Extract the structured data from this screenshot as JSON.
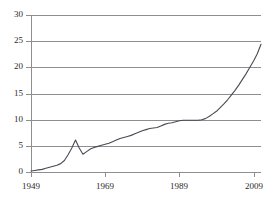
{
  "chart_data": {
    "type": "line",
    "title": "",
    "xlabel": "",
    "ylabel": "",
    "xlim": [
      1949,
      2011
    ],
    "ylim": [
      0,
      30
    ],
    "grid": true,
    "legend": null,
    "y_ticks": [
      0,
      5,
      10,
      15,
      20,
      25,
      30
    ],
    "x_ticks": [
      1949,
      1969,
      1989,
      2009
    ],
    "x_tick_labels": [
      "1949",
      "1969",
      "1989",
      "2009"
    ],
    "y_tick_labels": [
      "0",
      "5",
      "10",
      "15",
      "20",
      "25",
      "30"
    ],
    "series": [
      {
        "name": "series-1",
        "color": "#4a4a55",
        "x": [
          1949,
          1950,
          1951,
          1952,
          1953,
          1954,
          1955,
          1956,
          1957,
          1958,
          1959,
          1960,
          1961,
          1962,
          1963,
          1964,
          1965,
          1966,
          1967,
          1968,
          1969,
          1970,
          1971,
          1972,
          1973,
          1974,
          1975,
          1976,
          1977,
          1978,
          1979,
          1980,
          1981,
          1982,
          1983,
          1984,
          1985,
          1986,
          1987,
          1988,
          1989,
          1990,
          1991,
          1992,
          1993,
          1994,
          1995,
          1996,
          1997,
          1998,
          1999,
          2000,
          2001,
          2002,
          2003,
          2004,
          2005,
          2006,
          2007,
          2008,
          2009,
          2010,
          2011
        ],
        "values": [
          0.2,
          0.3,
          0.4,
          0.5,
          0.7,
          0.9,
          1.1,
          1.3,
          1.6,
          2.2,
          3.3,
          4.6,
          6.1,
          4.6,
          3.4,
          3.9,
          4.4,
          4.7,
          4.9,
          5.1,
          5.3,
          5.5,
          5.8,
          6.1,
          6.4,
          6.6,
          6.8,
          7.0,
          7.3,
          7.6,
          7.9,
          8.1,
          8.3,
          8.4,
          8.5,
          8.8,
          9.1,
          9.3,
          9.4,
          9.6,
          9.8,
          9.9,
          9.9,
          9.9,
          9.9,
          9.9,
          10.0,
          10.2,
          10.6,
          11.1,
          11.6,
          12.3,
          13.0,
          13.8,
          14.7,
          15.6,
          16.6,
          17.7,
          18.8,
          20.0,
          21.2,
          22.6,
          24.4
        ]
      }
    ]
  },
  "axes": {
    "y_title": "",
    "x_title": ""
  }
}
